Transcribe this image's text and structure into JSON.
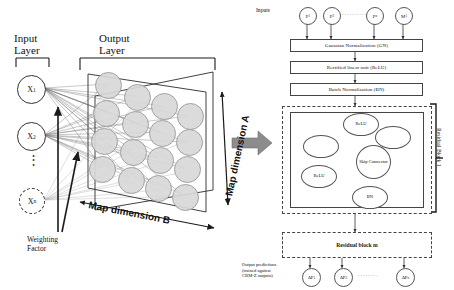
{
  "figure": {
    "type": "diagram"
  },
  "left_panel": {
    "input_layer_label_line1": "Input",
    "input_layer_label_line2": "Layer",
    "output_layer_label_line1": "Output",
    "output_layer_label_line2": "Layer",
    "input_nodes": [
      {
        "base": "X",
        "sub": "1",
        "dashed": false
      },
      {
        "base": "X",
        "sub": "2",
        "dashed": false
      },
      {
        "base": "X",
        "sub": "n",
        "dashed": true
      }
    ],
    "vertical_ellipsis": "⋮",
    "weighting_factor_line1": "Weighting",
    "weighting_factor_line2": "Factor",
    "map_dimension_a": "Map dimension A",
    "map_dimension_b": "Map dimension B",
    "map_grid_rows": 4,
    "map_grid_cols": 4,
    "map_cell_color": "#d8d8d8",
    "map_cell_border": "#9a9a9a"
  },
  "transition": {
    "arrow_name": "big-gray-arrow",
    "arrow_color": "#8c8c8c"
  },
  "right_panel": {
    "inputs_label": "Inputs",
    "input_nodes": [
      {
        "base": "P",
        "sub": "1"
      },
      {
        "base": "P",
        "sub": "2"
      },
      {
        "base": "P",
        "sub": "n"
      },
      {
        "base": "M",
        "sub": "1"
      }
    ],
    "input_dots": "··········",
    "process_boxes": [
      "Gaussian Normalization (GN)",
      "Rectified linear unit (ReLU)",
      "Batch Normalization (BN)"
    ],
    "residual_block_1": {
      "label": "Residual Block 1",
      "ellipses": [
        {
          "id": "relu-top",
          "text": "ReLU"
        },
        {
          "id": "blank-right",
          "text": ""
        },
        {
          "id": "blank-left",
          "text": ""
        },
        {
          "id": "skip-connector",
          "text": "Skip Connec­tor"
        },
        {
          "id": "relu-bottom",
          "text": "ReLU"
        },
        {
          "id": "bn",
          "text": "BN"
        }
      ]
    },
    "residual_block_m": "Residual block m",
    "output_caption_line1": "Output predictions",
    "output_caption_line2": "(trained against",
    "output_caption_line3": "CBM-Z outputs)",
    "output_nodes": [
      {
        "base": "ΔP",
        "sub": "1"
      },
      {
        "base": "ΔP",
        "sub": "2"
      },
      {
        "base": "ΔP",
        "sub": "n"
      }
    ],
    "output_dots": "········"
  }
}
